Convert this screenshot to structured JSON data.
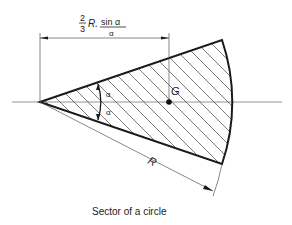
{
  "figure": {
    "caption": "Sector of a circle",
    "dimension_formula": {
      "fraction_num": "2",
      "fraction_den": "3",
      "radius_symbol": "R.",
      "trig_num": "sin α",
      "trig_den": "α"
    },
    "centroid_label": "G",
    "radius_label": "R",
    "half_angle_upper": "α",
    "half_angle_lower": "α"
  },
  "colors": {
    "stroke": "#1a1a1a",
    "thin": "#555555",
    "hatch": "#444444"
  }
}
